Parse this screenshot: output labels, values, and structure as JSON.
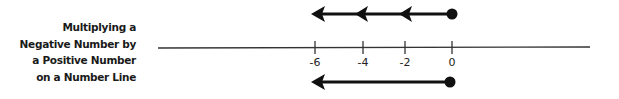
{
  "title": {
    "lines": [
      "Multiplying a",
      "Negative Number by",
      "a Positive Number",
      "on a Number Line"
    ]
  },
  "number_line": {
    "ticks": [
      {
        "value": -6,
        "label": "-6"
      },
      {
        "value": -4,
        "label": "-4"
      },
      {
        "value": -2,
        "label": "-2"
      },
      {
        "value": 0,
        "label": "0"
      }
    ]
  },
  "top_arrow": {
    "description": "Repeated jumps of -2 starting at 0",
    "start": 0,
    "end": -6,
    "intermediate_arrowheads": [
      -4,
      -2
    ]
  },
  "bottom_arrow": {
    "description": "Single jump from 0 to -6",
    "start": 0,
    "end": -6
  },
  "colors": {
    "stroke": "#111111",
    "axis": "#333333",
    "text": "#1a1a1a"
  }
}
